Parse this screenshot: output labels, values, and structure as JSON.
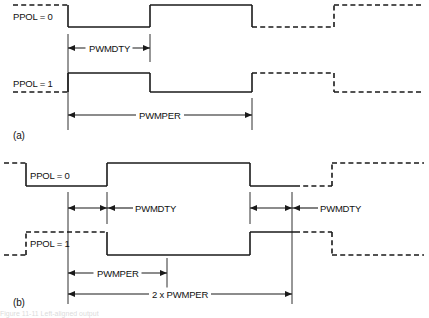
{
  "figure": {
    "type": "timing-diagram",
    "title_fragment": "Figure  11-11  Left-aligned output",
    "background": "#ffffff",
    "line_color": "#1a1a1a",
    "panels": [
      {
        "id": "a",
        "panel_label": "(a)",
        "signals": [
          {
            "name": "PPOL = 0",
            "label": "PPOL = 0"
          },
          {
            "name": "PPOL = 1",
            "label": "PPOL = 1"
          }
        ],
        "measures": [
          {
            "name": "duty",
            "label": "PWMDTY"
          },
          {
            "name": "period",
            "label": "PWMPER"
          }
        ]
      },
      {
        "id": "b",
        "panel_label": "(b)",
        "signals": [
          {
            "name": "PPOL = 0",
            "label": "PPOL = 0"
          },
          {
            "name": "PPOL = 1",
            "label": "PPOL = 1"
          }
        ],
        "measures": [
          {
            "name": "duty-first",
            "label": "PWMDTY"
          },
          {
            "name": "duty-second",
            "label": "PWMDTY"
          },
          {
            "name": "period",
            "label": "PWMPER"
          },
          {
            "name": "double-period",
            "label": "2 x PWMPER"
          }
        ]
      }
    ]
  },
  "chart_data": {
    "type": "line",
    "xlabel": "",
    "ylabel": "",
    "grid": false,
    "legend": "none",
    "xlim": [
      0,
      429
    ],
    "series": [
      {
        "name": "a-PPOL0",
        "panel": "a",
        "high_y": 5,
        "low_y": 27,
        "segments": [
          {
            "x0": 13,
            "x1": 68,
            "level": "high",
            "style": "dashed"
          },
          {
            "x0": 68,
            "x1": 150,
            "level": "low",
            "style": "solid"
          },
          {
            "x0": 150,
            "x1": 252,
            "level": "high",
            "style": "solid"
          },
          {
            "x0": 252,
            "x1": 334,
            "level": "low",
            "style": "dashed"
          },
          {
            "x0": 334,
            "x1": 424,
            "level": "high",
            "style": "dashed"
          }
        ]
      },
      {
        "name": "a-PPOL1",
        "panel": "a",
        "high_y": 73,
        "low_y": 92,
        "segments": [
          {
            "x0": 13,
            "x1": 68,
            "level": "low",
            "style": "dashed"
          },
          {
            "x0": 68,
            "x1": 150,
            "level": "high",
            "style": "solid"
          },
          {
            "x0": 150,
            "x1": 252,
            "level": "low",
            "style": "solid"
          },
          {
            "x0": 252,
            "x1": 334,
            "level": "high",
            "style": "dashed"
          },
          {
            "x0": 334,
            "x1": 424,
            "level": "low",
            "style": "dashed"
          }
        ]
      },
      {
        "name": "b-PPOL0",
        "panel": "b",
        "high_y": 163,
        "low_y": 186,
        "segments": [
          {
            "x0": 4,
            "x1": 26,
            "level": "high",
            "style": "dashed"
          },
          {
            "x0": 26,
            "x1": 107,
            "level": "low",
            "style": "solid"
          },
          {
            "x0": 107,
            "x1": 250,
            "level": "high",
            "style": "solid"
          },
          {
            "x0": 250,
            "x1": 295,
            "level": "low",
            "style": "solid"
          },
          {
            "x0": 295,
            "x1": 332,
            "level": "low",
            "style": "dashed"
          },
          {
            "x0": 332,
            "x1": 424,
            "level": "high",
            "style": "dashed"
          }
        ]
      },
      {
        "name": "b-PPOL1",
        "panel": "b",
        "high_y": 232,
        "low_y": 255,
        "segments": [
          {
            "x0": 4,
            "x1": 26,
            "level": "low",
            "style": "dashed"
          },
          {
            "x0": 26,
            "x1": 107,
            "level": "high",
            "style": "dashed"
          },
          {
            "x0": 107,
            "x1": 250,
            "level": "low",
            "style": "solid"
          },
          {
            "x0": 250,
            "x1": 295,
            "level": "high",
            "style": "solid"
          },
          {
            "x0": 295,
            "x1": 332,
            "level": "high",
            "style": "dashed"
          },
          {
            "x0": 332,
            "x1": 424,
            "level": "low",
            "style": "dashed"
          }
        ]
      }
    ],
    "annotations": [
      {
        "name": "a-duty",
        "label": "PWMDTY",
        "x0": 68,
        "x1": 150,
        "y": 48,
        "panel": "a",
        "label_inside": true
      },
      {
        "name": "a-period",
        "label": "PWMPER",
        "x0": 68,
        "x1": 252,
        "y": 115,
        "panel": "a",
        "label_inside": true
      },
      {
        "name": "b-duty-1",
        "label": "PWMDTY",
        "x0": 68,
        "x1": 107,
        "y": 208,
        "panel": "b",
        "label_inside": false
      },
      {
        "name": "b-duty-2",
        "label": "PWMDTY",
        "x0": 250,
        "x1": 292,
        "y": 208,
        "panel": "b",
        "label_inside": false
      },
      {
        "name": "b-period",
        "label": "PWMPER",
        "x0": 68,
        "x1": 167,
        "y": 273,
        "panel": "b",
        "label_inside": true
      },
      {
        "name": "b-double-period",
        "label": "2 x PWMPER",
        "x0": 68,
        "x1": 292,
        "y": 294,
        "panel": "b",
        "label_inside": true
      }
    ],
    "guides": [
      {
        "x": 68,
        "y0": 34,
        "y1": 130,
        "panel": "a"
      },
      {
        "x": 150,
        "y0": 34,
        "y1": 62,
        "panel": "a"
      },
      {
        "x": 252,
        "y0": 98,
        "y1": 130,
        "panel": "a"
      },
      {
        "x": 68,
        "y0": 192,
        "y1": 304,
        "panel": "b"
      },
      {
        "x": 107,
        "y0": 192,
        "y1": 224,
        "panel": "b"
      },
      {
        "x": 167,
        "y0": 258,
        "y1": 288,
        "panel": "b"
      },
      {
        "x": 250,
        "y0": 192,
        "y1": 224,
        "panel": "b"
      },
      {
        "x": 292,
        "y0": 192,
        "y1": 304,
        "panel": "b"
      }
    ]
  }
}
